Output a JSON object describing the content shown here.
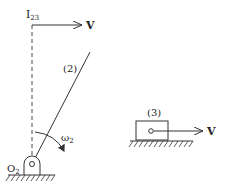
{
  "diagram": {
    "type": "mechanism",
    "labels": {
      "instant_center": "I",
      "instant_center_sub": "23",
      "velocity_top": "V",
      "link2": "(2)",
      "omega": "ω",
      "omega_sub": "2",
      "pivot": "O",
      "pivot_sub": "2",
      "block": "(3)",
      "velocity_block": "V"
    },
    "colors": {
      "stroke": "#333333",
      "background": "#ffffff"
    }
  }
}
